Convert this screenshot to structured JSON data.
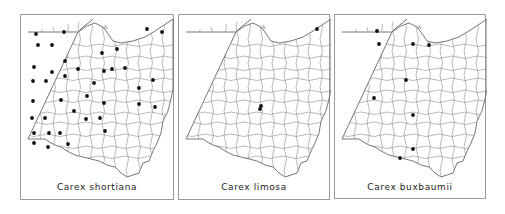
{
  "figure": {
    "panels": [
      {
        "species": "Carex shortiana",
        "frame": {
          "x": 20,
          "y": 14,
          "w": 154,
          "h": 186
        },
        "dots": [
          [
            35,
            33
          ],
          [
            63,
            31
          ],
          [
            37,
            44
          ],
          [
            51,
            44
          ],
          [
            64,
            60
          ],
          [
            33,
            66
          ],
          [
            51,
            71
          ],
          [
            64,
            75
          ],
          [
            77,
            68
          ],
          [
            32,
            80
          ],
          [
            45,
            80
          ],
          [
            146,
            28
          ],
          [
            161,
            31
          ],
          [
            101,
            52
          ],
          [
            116,
            48
          ],
          [
            103,
            70
          ],
          [
            111,
            68
          ],
          [
            124,
            67
          ],
          [
            93,
            82
          ],
          [
            152,
            79
          ],
          [
            138,
            87
          ],
          [
            86,
            95
          ],
          [
            103,
            102
          ],
          [
            138,
            103
          ],
          [
            154,
            106
          ],
          [
            32,
            100
          ],
          [
            60,
            99
          ],
          [
            73,
            110
          ],
          [
            31,
            117
          ],
          [
            44,
            117
          ],
          [
            85,
            118
          ],
          [
            99,
            117
          ],
          [
            33,
            132
          ],
          [
            48,
            132
          ],
          [
            59,
            132
          ],
          [
            104,
            130
          ],
          [
            33,
            142
          ],
          [
            47,
            146
          ],
          [
            67,
            143
          ]
        ]
      },
      {
        "species": "Carex limosa",
        "frame": {
          "x": 178,
          "y": 14,
          "w": 152,
          "h": 186
        },
        "dots": [
          [
            316,
            28
          ],
          [
            260,
            105
          ],
          [
            259,
            108
          ]
        ]
      },
      {
        "species": "Carex buxbaumii",
        "frame": {
          "x": 334,
          "y": 14,
          "w": 152,
          "h": 185
        },
        "dots": [
          [
            376,
            30
          ],
          [
            378,
            43
          ],
          [
            412,
            43
          ],
          [
            428,
            44
          ],
          [
            405,
            79
          ],
          [
            373,
            97
          ],
          [
            412,
            114
          ],
          [
            412,
            148
          ],
          [
            399,
            157
          ]
        ]
      }
    ],
    "colors": {
      "dot": "#111111",
      "county_line": "#8c8c8c",
      "frame": "#9a9a9a"
    }
  }
}
